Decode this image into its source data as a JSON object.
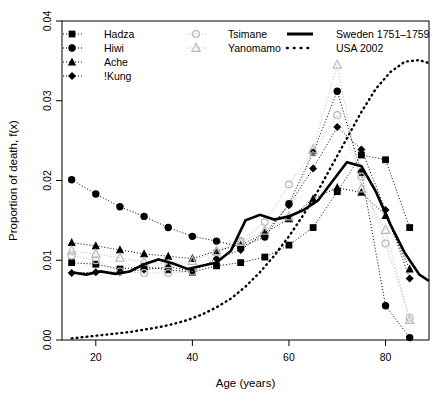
{
  "chart_data": {
    "type": "line",
    "title": "",
    "xlabel": "Age (years)",
    "ylabel": "Proportion of death, f(x)",
    "xlim": [
      13,
      89
    ],
    "ylim": [
      0.0,
      0.04
    ],
    "xticks": [
      20,
      40,
      60,
      80
    ],
    "xtick_labels": [
      "20",
      "40",
      "60",
      "80"
    ],
    "yticks": [
      0.0,
      0.01,
      0.02,
      0.03,
      0.04
    ],
    "ytick_labels": [
      "0.00",
      "0.01",
      "0.02",
      "0.03",
      "0.04"
    ],
    "grid": false,
    "legend_position": "top",
    "series": [
      {
        "name": "Hadza",
        "marker": "filled-square",
        "linestyle": "dotted",
        "color": "#000000",
        "x": [
          15,
          20,
          25,
          30,
          35,
          40,
          45,
          50,
          55,
          60,
          65,
          70,
          75,
          80,
          85
        ],
        "y": [
          0.0097,
          0.0095,
          0.0089,
          0.0092,
          0.0088,
          0.0085,
          0.0093,
          0.0097,
          0.0104,
          0.0119,
          0.0141,
          0.0186,
          0.0232,
          0.0226,
          0.0141
        ]
      },
      {
        "name": "Hiwi",
        "marker": "filled-circle",
        "linestyle": "dotted",
        "color": "#000000",
        "x": [
          15,
          20,
          25,
          30,
          35,
          40,
          45,
          50,
          55,
          60,
          65,
          70,
          75,
          80,
          85
        ],
        "y": [
          0.0201,
          0.0183,
          0.0167,
          0.0155,
          0.0141,
          0.013,
          0.0124,
          0.0117,
          0.0129,
          0.0171,
          0.0235,
          0.0312,
          0.021,
          0.0043,
          0.0003
        ]
      },
      {
        "name": "Ache",
        "marker": "filled-triangle",
        "linestyle": "dotted",
        "color": "#000000",
        "x": [
          15,
          20,
          25,
          30,
          35,
          40,
          45,
          50,
          55,
          60,
          65,
          70,
          75,
          80,
          85
        ],
        "y": [
          0.0122,
          0.0118,
          0.0113,
          0.0108,
          0.0105,
          0.0102,
          0.0112,
          0.0119,
          0.0134,
          0.0152,
          0.0177,
          0.0191,
          0.0185,
          0.0156,
          0.0089
        ]
      },
      {
        "name": "!Kung",
        "marker": "filled-diamond",
        "linestyle": "dotted",
        "color": "#000000",
        "x": [
          15,
          20,
          25,
          30,
          35,
          40,
          45,
          50,
          55,
          60,
          65,
          70,
          75,
          80,
          85
        ],
        "y": [
          0.0084,
          0.0085,
          0.0085,
          0.0088,
          0.0092,
          0.0086,
          0.0102,
          0.0113,
          0.0134,
          0.0169,
          0.0215,
          0.0267,
          0.0239,
          0.0163,
          0.0077
        ]
      },
      {
        "name": "Tsimane",
        "marker": "open-circle",
        "linestyle": "dotted",
        "color": "#b9b9b9",
        "x": [
          15,
          20,
          25,
          30,
          35,
          40,
          45,
          50,
          55,
          60,
          65,
          70,
          75,
          80,
          85
        ],
        "y": [
          0.0106,
          0.01,
          0.0086,
          0.0084,
          0.0084,
          0.0086,
          0.011,
          0.0124,
          0.0148,
          0.0195,
          0.0236,
          0.0282,
          0.0205,
          0.0121,
          0.0028
        ]
      },
      {
        "name": "Yanomamo",
        "marker": "open-triangle",
        "linestyle": "dotted",
        "color": "#b9b9b9",
        "x": [
          15,
          20,
          25,
          30,
          35,
          40,
          45,
          50,
          55,
          60,
          65,
          70,
          75,
          80,
          85
        ],
        "y": [
          0.0112,
          0.0108,
          0.0103,
          0.0098,
          0.0095,
          0.0099,
          0.0111,
          0.0123,
          0.0137,
          0.0155,
          0.0239,
          0.0345,
          0.019,
          0.0138,
          0.0025
        ]
      },
      {
        "name": "Sweden 1751-1759",
        "marker": "none",
        "linestyle": "solid",
        "color": "#000000",
        "x": [
          15,
          18,
          21,
          24,
          27,
          30,
          33,
          36,
          39,
          42,
          45,
          48,
          51,
          54,
          57,
          60,
          63,
          66,
          69,
          72,
          75,
          78,
          81,
          84,
          87,
          89
        ],
        "y": [
          0.0085,
          0.0082,
          0.0086,
          0.0083,
          0.0086,
          0.0095,
          0.0101,
          0.0096,
          0.0089,
          0.0093,
          0.0097,
          0.0112,
          0.015,
          0.0157,
          0.0151,
          0.0155,
          0.0163,
          0.0175,
          0.0199,
          0.0223,
          0.0218,
          0.0186,
          0.0145,
          0.0109,
          0.0082,
          0.0074
        ]
      },
      {
        "name": "USA 2002",
        "marker": "none",
        "linestyle": "dotted-thick",
        "color": "#000000",
        "x": [
          15,
          18,
          21,
          24,
          27,
          30,
          33,
          36,
          39,
          42,
          45,
          48,
          51,
          54,
          57,
          60,
          63,
          66,
          69,
          72,
          75,
          78,
          81,
          84,
          87,
          89
        ],
        "y": [
          0.0002,
          0.0004,
          0.0006,
          0.0008,
          0.001,
          0.0013,
          0.0016,
          0.002,
          0.0025,
          0.0032,
          0.0041,
          0.0052,
          0.0067,
          0.0085,
          0.0106,
          0.013,
          0.0157,
          0.0187,
          0.022,
          0.0253,
          0.0286,
          0.0315,
          0.0336,
          0.0349,
          0.0351,
          0.0347
        ]
      }
    ]
  },
  "legend": {
    "columns": [
      {
        "entries": [
          {
            "label": "Hadza",
            "marker": "filled-square",
            "linestyle": "dotted",
            "color": "#000000"
          },
          {
            "label": "Hiwi",
            "marker": "filled-circle",
            "linestyle": "dotted",
            "color": "#000000"
          },
          {
            "label": "Ache",
            "marker": "filled-triangle",
            "linestyle": "dotted",
            "color": "#000000"
          },
          {
            "label": "!Kung",
            "marker": "filled-diamond",
            "linestyle": "dotted",
            "color": "#000000"
          }
        ]
      },
      {
        "entries": [
          {
            "label": "Tsimane",
            "marker": "open-circle",
            "linestyle": "dotted",
            "color": "#b9b9b9"
          },
          {
            "label": "Yanomamo",
            "marker": "open-triangle",
            "linestyle": "dotted",
            "color": "#b9b9b9"
          }
        ]
      },
      {
        "entries": [
          {
            "label": "Sweden 1751–1759",
            "marker": "none",
            "linestyle": "solid",
            "color": "#000000"
          },
          {
            "label": "USA 2002",
            "marker": "none",
            "linestyle": "dotted-thick",
            "color": "#000000"
          }
        ]
      }
    ]
  }
}
